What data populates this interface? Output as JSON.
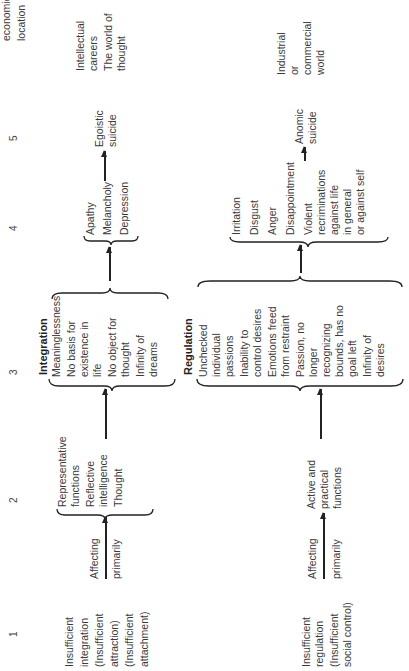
{
  "columns": [
    "1",
    "2",
    "3",
    "4",
    "5"
  ],
  "row_integration": {
    "cause": [
      "Insufficient",
      "integration",
      "(Insufficient",
      "attraction)",
      "(Insufficient",
      "attachment)"
    ],
    "affecting": "Affecting",
    "primarily": "primarily",
    "functions": [
      "Representative",
      "functions",
      "Reflective",
      "intelligence",
      "Thought"
    ],
    "section_title": "Integration",
    "states": [
      "Meaninglessness",
      "No basis for",
      "existence in",
      "life",
      "No object for",
      "thought",
      "Infinity of",
      "dreams"
    ],
    "emotions": [
      "Apathy",
      "Melancholy",
      "Depression"
    ],
    "outcome": [
      "Egoistic",
      "suicide"
    ]
  },
  "row_regulation": {
    "cause": [
      "Insufficient",
      "regulation",
      "(Insufficient",
      "social control)"
    ],
    "affecting": "Affecting",
    "primarily": "primarily",
    "functions": [
      "Active and",
      "practical",
      "functions"
    ],
    "section_title": "Regulation",
    "states": [
      "Unchecked",
      "individual",
      "passions",
      "Inability to",
      "control desires",
      "Emotions freed",
      "from restraint",
      "Passion, no",
      "longer",
      "recognizing",
      "bounds, has no",
      "goal left",
      "Infinity of",
      "desires"
    ],
    "emotions": [
      "Irritation",
      "Disgust",
      "Anger",
      "Disappointment",
      "Violent",
      "recriminations",
      "against life",
      "in general",
      "or against self"
    ],
    "outcome": [
      "Anomic",
      "suicide"
    ]
  },
  "socio_economic": {
    "header": [
      "economic",
      "location"
    ],
    "integration": [
      "Intellectual",
      "careers",
      "The world of",
      "thought"
    ],
    "regulation": [
      "Industrial",
      "or",
      "commercial",
      "world"
    ]
  }
}
